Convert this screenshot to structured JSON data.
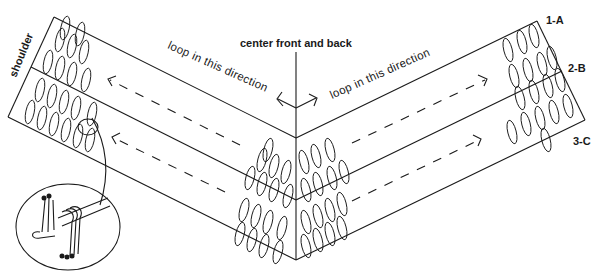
{
  "diagram": {
    "labels": {
      "center": "center front and back",
      "left_direction": "loop in this direction",
      "right_direction": "loop in this direction",
      "shoulder": "shoulder",
      "row1": "1-A",
      "row2": "2-B",
      "row3": "3-C"
    },
    "detail_inset": "loop-wrapping-detail"
  }
}
